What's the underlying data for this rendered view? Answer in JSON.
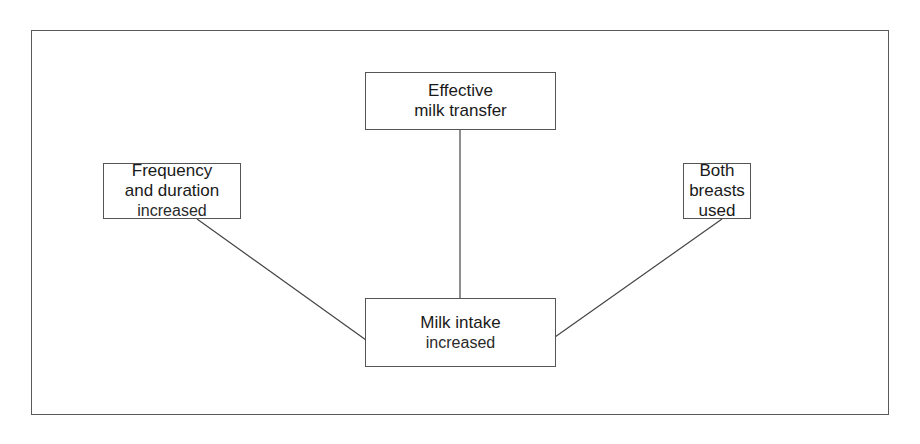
{
  "diagram": {
    "nodes": {
      "frequency": {
        "line1": "Frequency",
        "line2": "and duration",
        "line3": "increased"
      },
      "transfer": {
        "line1": "Effective",
        "line2": "milk transfer"
      },
      "breasts": {
        "line1": "Both",
        "line2": "breasts",
        "line3": "used"
      },
      "intake": {
        "line1": "Milk intake",
        "line2": "increased"
      }
    },
    "edges": [
      {
        "from": "frequency",
        "to": "intake"
      },
      {
        "from": "transfer",
        "to": "intake"
      },
      {
        "from": "breasts",
        "to": "intake"
      }
    ]
  }
}
